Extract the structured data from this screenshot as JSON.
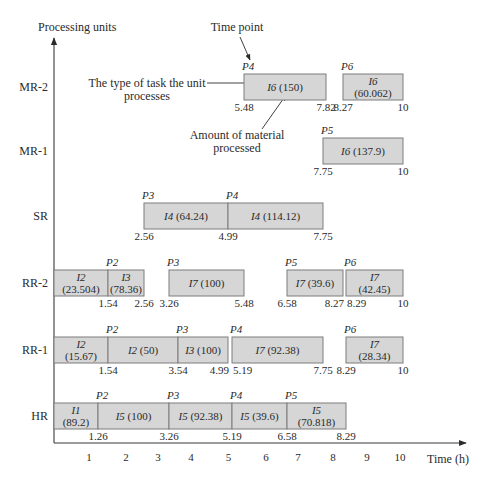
{
  "chart_data": {
    "type": "bar",
    "subtype": "gantt",
    "title": "",
    "xlabel": "Time (h)",
    "ylabel": "Processing units",
    "xlim": [
      0,
      10
    ],
    "x_ticks": [
      "1",
      "2",
      "3",
      "4",
      "5",
      "6",
      "7",
      "8",
      "9",
      "10"
    ],
    "grid": false,
    "legend": null,
    "rows": [
      {
        "unit": "MR-2",
        "tasks": [
          {
            "task": "I6",
            "amount": "150",
            "start": 5.48,
            "end": 7.82,
            "point": "P4"
          },
          {
            "task": "I6",
            "amount": "60.062",
            "start": 8.27,
            "end": 10,
            "point": "P6"
          }
        ],
        "time_labels": [
          "5.48",
          "7.82",
          "8.27",
          "10"
        ]
      },
      {
        "unit": "MR-1",
        "tasks": [
          {
            "task": "I6",
            "amount": "137.9",
            "start": 7.75,
            "end": 10,
            "point": "P5"
          }
        ],
        "time_labels": [
          "7.75",
          "10"
        ]
      },
      {
        "unit": "SR",
        "tasks": [
          {
            "task": "I4",
            "amount": "64.24",
            "start": 2.56,
            "end": 4.99,
            "point": "P3"
          },
          {
            "task": "I4",
            "amount": "114.12",
            "start": 4.99,
            "end": 7.75,
            "point": "P4"
          }
        ],
        "time_labels": [
          "2.56",
          "4.99",
          "7.75"
        ]
      },
      {
        "unit": "RR-2",
        "tasks": [
          {
            "task": "I2",
            "amount": "23.504",
            "start": 0,
            "end": 1.54,
            "point": ""
          },
          {
            "task": "I3",
            "amount": "78.36",
            "start": 1.54,
            "end": 2.56,
            "point": "P2"
          },
          {
            "task": "I7",
            "amount": "100",
            "start": 3.26,
            "end": 5.48,
            "point": "P3"
          },
          {
            "task": "I7",
            "amount": "39.6",
            "start": 6.58,
            "end": 8.27,
            "point": "P5"
          },
          {
            "task": "I7",
            "amount": "42.45",
            "start": 8.29,
            "end": 10,
            "point": "P6"
          }
        ],
        "time_labels": [
          "1.54",
          "2.56",
          "3.26",
          "5.48",
          "6.58",
          "8.27",
          "8.29",
          "10"
        ]
      },
      {
        "unit": "RR-1",
        "tasks": [
          {
            "task": "I2",
            "amount": "15.67",
            "start": 0,
            "end": 1.54,
            "point": ""
          },
          {
            "task": "I2",
            "amount": "50",
            "start": 1.54,
            "end": 3.54,
            "point": "P2"
          },
          {
            "task": "I3",
            "amount": "100",
            "start": 3.54,
            "end": 4.99,
            "point": "P3"
          },
          {
            "task": "I7",
            "amount": "92.38",
            "start": 5.19,
            "end": 7.75,
            "point": "P4"
          },
          {
            "task": "I7",
            "amount": "28.34",
            "start": 8.29,
            "end": 10,
            "point": "P6"
          }
        ],
        "time_labels": [
          "1.54",
          "3.54",
          "4.99",
          "5.19",
          "7.75",
          "8.29",
          "10"
        ]
      },
      {
        "unit": "HR",
        "tasks": [
          {
            "task": "I1",
            "amount": "89.2",
            "start": 0,
            "end": 1.26,
            "point": ""
          },
          {
            "task": "I5",
            "amount": "100",
            "start": 1.26,
            "end": 3.26,
            "point": "P2"
          },
          {
            "task": "I5",
            "amount": "92.38",
            "start": 3.26,
            "end": 5.19,
            "point": "P3"
          },
          {
            "task": "I5",
            "amount": "39.6",
            "start": 5.19,
            "end": 6.58,
            "point": "P4"
          },
          {
            "task": "I5",
            "amount": "70.818",
            "start": 6.58,
            "end": 8.29,
            "point": "P5"
          }
        ],
        "time_labels": [
          "1.26",
          "3.26",
          "5.19",
          "6.58",
          "8.29"
        ]
      }
    ],
    "annotations": {
      "time_point": "Time point",
      "task_type": [
        "The type of task the unit",
        "processes"
      ],
      "material": [
        "Amount of material",
        "processed"
      ]
    }
  }
}
